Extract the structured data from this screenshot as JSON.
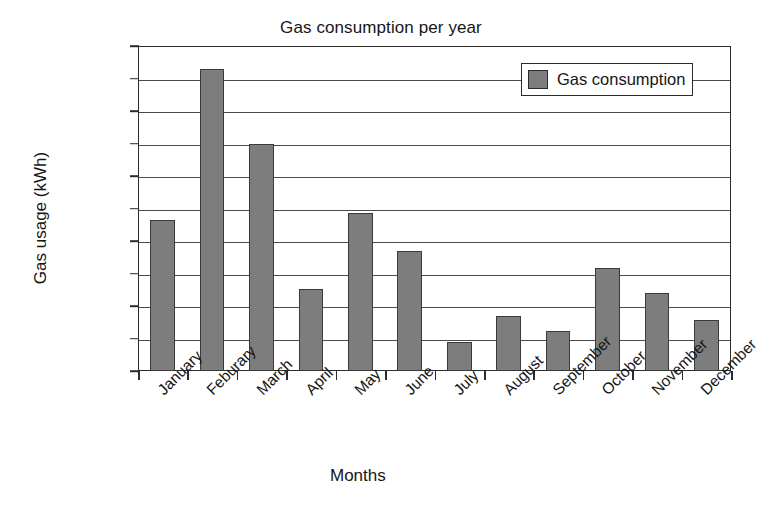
{
  "chart_data": {
    "type": "bar",
    "title": "Gas consumption per year",
    "xlabel": "Months",
    "ylabel": "Gas usage (kWh)",
    "categories": [
      "January",
      "Feburary",
      "March",
      "April",
      "May",
      "June",
      "July",
      "August",
      "September",
      "October",
      "November",
      "December"
    ],
    "values": [
      23300,
      46400,
      35000,
      12600,
      24300,
      18400,
      4500,
      8400,
      6200,
      15800,
      12000,
      7900
    ],
    "series": [
      {
        "name": "Gas consumption",
        "values": [
          23300,
          46400,
          35000,
          12600,
          24300,
          18400,
          4500,
          8400,
          6200,
          15800,
          12000,
          7900
        ]
      }
    ],
    "ylim": [
      0,
      50000
    ],
    "ytick_step": 5000,
    "yticks": [
      "50000",
      "45000",
      "40000",
      "35000",
      "30000",
      "25000",
      "20000",
      "15000",
      "10000",
      "5000",
      "0"
    ],
    "ytick_values": [
      50000,
      45000,
      40000,
      35000,
      30000,
      25000,
      20000,
      15000,
      10000,
      5000,
      0
    ],
    "grid": true,
    "grid_axis": "y",
    "legend": {
      "position": "top-right",
      "entries": [
        {
          "label": "Gas consumption",
          "color": "#7d7d7d"
        }
      ]
    },
    "xtick_label_rotation": -45,
    "bar_color": "#7d7d7d",
    "bar_border_color": "#3a3a3a",
    "axis_color": "#2b2b2b",
    "background_color": "#ffffff"
  }
}
